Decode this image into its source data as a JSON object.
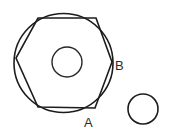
{
  "figure": {
    "title": "Hexagon inscribed in circle with labelled points A and B",
    "background_color": "#ffffff",
    "stroke_color": "#1c1c1c",
    "label_color": "#2b2b2b",
    "canvas": {
      "width": 170,
      "height": 137
    },
    "shapes": {
      "outer_circle": {
        "name": "large-circle",
        "cx": 63.5,
        "cy": 63,
        "r": 49.5
      },
      "inner_circle": {
        "name": "inner-small-circle",
        "cx": 67,
        "cy": 62,
        "r": 15
      },
      "detached_circle": {
        "name": "separate-small-circle",
        "cx": 143,
        "cy": 109,
        "r": 15
      },
      "hexagon": {
        "name": "inscribed-hexagon",
        "points": "38,18 96,18 112,62 95,108 38,107 16,58"
      }
    },
    "labels": [
      {
        "id": "label-b",
        "text": "B",
        "x": 115,
        "y": 70
      },
      {
        "id": "label-a",
        "text": "A",
        "x": 84,
        "y": 127
      }
    ]
  }
}
